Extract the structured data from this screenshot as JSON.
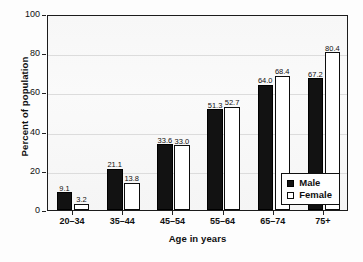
{
  "chart_data": {
    "type": "bar",
    "title": "",
    "subtitle": "",
    "xlabel": "Age in years",
    "ylabel": "Percent of population",
    "categories": [
      "20–34",
      "35–44",
      "45–54",
      "55–64",
      "65–74",
      "75+"
    ],
    "series": [
      {
        "name": "Male",
        "color": "#121212",
        "values": [
          9.1,
          21.1,
          33.6,
          51.3,
          64.0,
          67.2
        ],
        "labels": [
          "9.1",
          "21.1",
          "33.6",
          "51.3",
          "64.0",
          "67.2"
        ]
      },
      {
        "name": "Female",
        "color": "#ffffff",
        "values": [
          3.2,
          13.8,
          33.0,
          52.7,
          68.4,
          80.4
        ],
        "labels": [
          "3.2",
          "13.8",
          "33.0",
          "52.7",
          "68.4",
          "80.4"
        ]
      }
    ],
    "ylim": [
      0,
      100
    ],
    "yticks": [
      0,
      20,
      40,
      60,
      80,
      100
    ],
    "ytick_labels": [
      "0",
      "20",
      "40",
      "60",
      "80",
      "100"
    ],
    "grid": true,
    "grid_axis": "y",
    "legend_position": "lower-right",
    "legend_entries": [
      "Male",
      "Female"
    ],
    "bar_value_labels": true
  },
  "axes": {
    "y_title": "Percent of population",
    "x_title": "Age in years"
  },
  "legend": {
    "items": [
      {
        "label": "Male",
        "swatch": "filled-black-square"
      },
      {
        "label": "Female",
        "swatch": "open-white-square"
      }
    ]
  }
}
